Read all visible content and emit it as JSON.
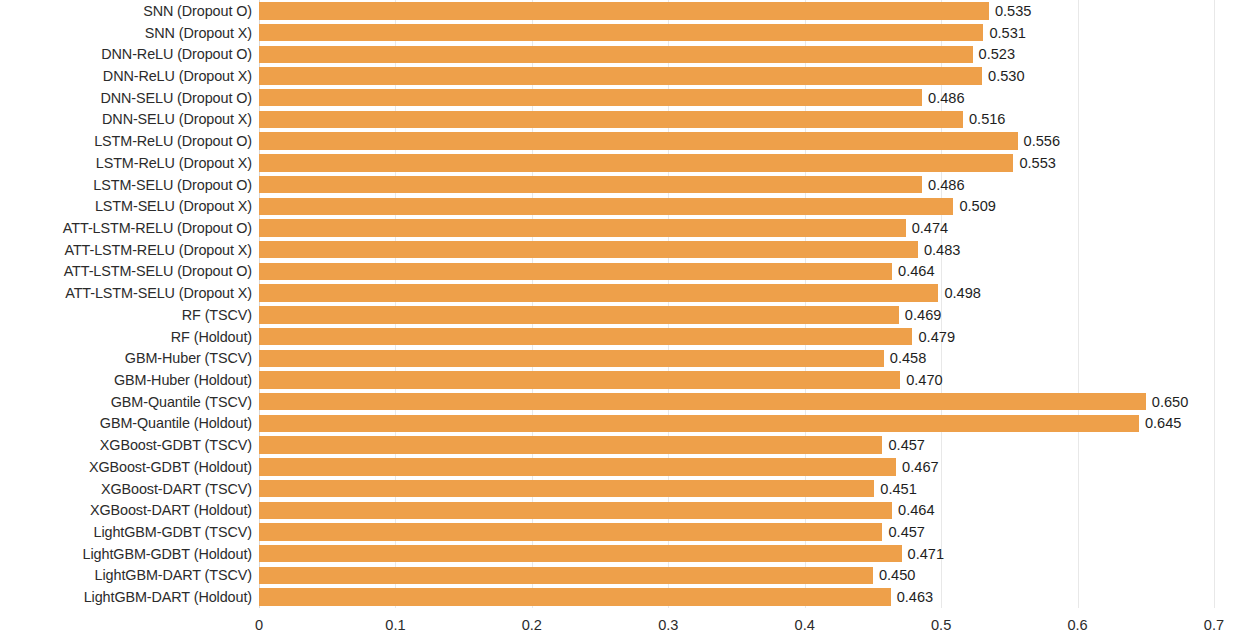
{
  "chart_data": {
    "type": "bar",
    "orientation": "horizontal",
    "title": "",
    "xlabel": "",
    "ylabel": "",
    "xlim": [
      0,
      0.7
    ],
    "xticks": [
      "0",
      "0.1",
      "0.2",
      "0.3",
      "0.4",
      "0.5",
      "0.6",
      "0.7"
    ],
    "xtick_values": [
      0,
      0.1,
      0.2,
      0.3,
      0.4,
      0.5,
      0.6,
      0.7
    ],
    "grid": "vertical-light",
    "legend": "none",
    "bar_color": "#eea04a",
    "value_label_format": "0.000",
    "categories": [
      "SNN (Dropout O)",
      "SNN (Dropout X)",
      "DNN-ReLU (Dropout O)",
      "DNN-ReLU (Dropout X)",
      "DNN-SELU (Dropout O)",
      "DNN-SELU (Dropout X)",
      "LSTM-ReLU (Dropout O)",
      "LSTM-ReLU (Dropout X)",
      "LSTM-SELU (Dropout O)",
      "LSTM-SELU (Dropout X)",
      "ATT-LSTM-RELU (Dropout O)",
      "ATT-LSTM-RELU (Dropout X)",
      "ATT-LSTM-SELU (Dropout O)",
      "ATT-LSTM-SELU (Dropout X)",
      "RF (TSCV)",
      "RF (Holdout)",
      "GBM-Huber (TSCV)",
      "GBM-Huber (Holdout)",
      "GBM-Quantile (TSCV)",
      "GBM-Quantile (Holdout)",
      "XGBoost-GDBT (TSCV)",
      "XGBoost-GDBT (Holdout)",
      "XGBoost-DART (TSCV)",
      "XGBoost-DART (Holdout)",
      "LightGBM-GDBT (TSCV)",
      "LightGBM-GDBT (Holdout)",
      "LightGBM-DART (TSCV)",
      "LightGBM-DART (Holdout)"
    ],
    "values": [
      0.535,
      0.531,
      0.523,
      0.53,
      0.486,
      0.516,
      0.556,
      0.553,
      0.486,
      0.509,
      0.474,
      0.483,
      0.464,
      0.498,
      0.469,
      0.479,
      0.458,
      0.47,
      0.65,
      0.645,
      0.457,
      0.467,
      0.451,
      0.464,
      0.457,
      0.471,
      0.45,
      0.463
    ],
    "value_labels": [
      "0.535",
      "0.531",
      "0.523",
      "0.530",
      "0.486",
      "0.516",
      "0.556",
      "0.553",
      "0.486",
      "0.509",
      "0.474",
      "0.483",
      "0.464",
      "0.498",
      "0.469",
      "0.479",
      "0.458",
      "0.470",
      "0.650",
      "0.645",
      "0.457",
      "0.467",
      "0.451",
      "0.464",
      "0.457",
      "0.471",
      "0.450",
      "0.463"
    ]
  }
}
